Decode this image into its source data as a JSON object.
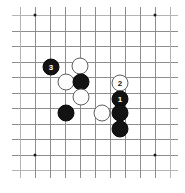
{
  "diagram": {
    "type": "go-board-diagram",
    "board": {
      "columns": 11,
      "rows": 11,
      "origin_x": 20,
      "origin_y": 15,
      "spacing_x": 15,
      "spacing_y": 15.5,
      "line_color": "#8d8d8d",
      "edge_line_color": "#b4b4b4",
      "background_color": "#ffffff"
    },
    "star_points": [
      {
        "name": "star-point-top-left",
        "col": 1,
        "row": 0
      },
      {
        "name": "star-point-top-right",
        "col": 9,
        "row": 0
      },
      {
        "name": "star-point-bottom-left",
        "col": 1,
        "row": 9
      },
      {
        "name": "star-point-bottom-right",
        "col": 9,
        "row": 9
      }
    ],
    "stone_colors": {
      "black_fill": "#131313",
      "black_stroke": "#0a0a0a",
      "black_label": "#ffffff",
      "white_fill": "#fdfdfd",
      "white_stroke": "#5f5f5f",
      "white_label": "#151515"
    },
    "stone_diameter": 17,
    "stones": [
      {
        "name": "stone-black-move-3",
        "color": "black",
        "label": "3",
        "x": 51,
        "y": 67
      },
      {
        "name": "stone-white-a",
        "color": "white",
        "label": "",
        "x": 80,
        "y": 66
      },
      {
        "name": "stone-white-b",
        "color": "white",
        "label": "",
        "x": 66,
        "y": 82
      },
      {
        "name": "stone-black-a",
        "color": "black",
        "label": "",
        "x": 81,
        "y": 82
      },
      {
        "name": "stone-white-move-2",
        "color": "white",
        "label": "2",
        "x": 120,
        "y": 83
      },
      {
        "name": "stone-white-c",
        "color": "white",
        "label": "",
        "x": 81,
        "y": 97
      },
      {
        "name": "stone-black-move-1",
        "color": "black",
        "label": "1",
        "x": 120,
        "y": 99
      },
      {
        "name": "stone-black-b",
        "color": "black",
        "label": "",
        "x": 66,
        "y": 113
      },
      {
        "name": "stone-white-d",
        "color": "white",
        "label": "",
        "x": 102,
        "y": 113
      },
      {
        "name": "stone-black-c",
        "color": "black",
        "label": "",
        "x": 120,
        "y": 113
      },
      {
        "name": "stone-black-d",
        "color": "black",
        "label": "",
        "x": 120,
        "y": 129
      }
    ],
    "move_sequence": [
      {
        "move": "1",
        "color": "black"
      },
      {
        "move": "2",
        "color": "white"
      },
      {
        "move": "3",
        "color": "black"
      }
    ]
  }
}
